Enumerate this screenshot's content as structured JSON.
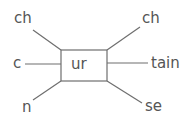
{
  "diagram": {
    "center": "ur",
    "left": [
      {
        "text": "ch"
      },
      {
        "text": "c"
      },
      {
        "text": "n"
      }
    ],
    "right": [
      {
        "text": "ch"
      },
      {
        "text": "tain"
      },
      {
        "text": "se"
      }
    ],
    "colors": {
      "line": "#6e6e6e",
      "text": "#555555",
      "background": "#ffffff"
    }
  }
}
